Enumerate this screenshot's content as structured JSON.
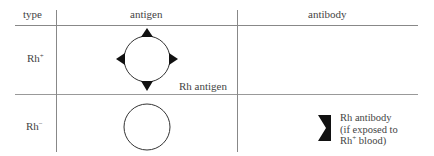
{
  "table": {
    "headers": {
      "type": "type",
      "antigen": "antigen",
      "antibody": "antibody"
    },
    "rows": [
      {
        "type_base": "Rh",
        "type_sup": "+",
        "antigen_label": "Rh antigen",
        "antibody": null
      },
      {
        "type_base": "Rh",
        "type_sup": "−",
        "antigen_label": null,
        "antibody": {
          "line1": "Rh antibody",
          "line2": "(if exposed to",
          "line3_base": "Rh",
          "line3_sup": "+",
          "line3_rest": " blood)"
        }
      }
    ]
  },
  "colors": {
    "lines": "#888888",
    "shapes": "#111111",
    "text": "#444444"
  }
}
